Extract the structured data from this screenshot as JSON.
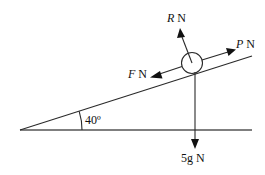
{
  "diagram": {
    "type": "inclined-plane-force-diagram",
    "incline_angle_label": "40º",
    "incline_angle_deg": 40,
    "particle": "circle",
    "forces": [
      {
        "id": "R",
        "symbol": "R",
        "unit": "N",
        "direction": "normal to plane, away"
      },
      {
        "id": "P",
        "symbol": "P",
        "unit": "N",
        "direction": "up the slope"
      },
      {
        "id": "F",
        "symbol": "F",
        "unit": "N",
        "direction": "down the slope"
      },
      {
        "id": "W",
        "symbol": "5g",
        "unit": "N",
        "direction": "vertically down"
      }
    ]
  },
  "labels": {
    "R_symbol": "R",
    "R_unit": " N",
    "P_symbol": "P",
    "P_unit": " N",
    "F_symbol": "F",
    "F_unit": " N",
    "W_text": "5g N",
    "angle": "40º"
  },
  "colors": {
    "ink": "#111111",
    "background": "#ffffff"
  }
}
